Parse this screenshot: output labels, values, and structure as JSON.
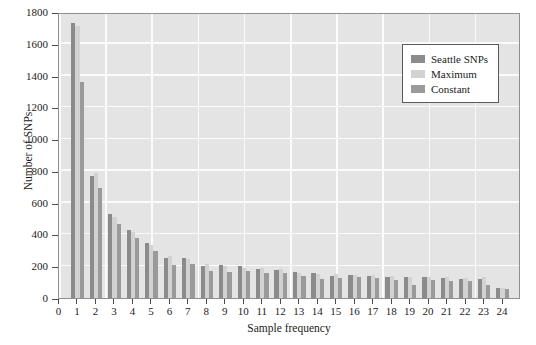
{
  "chart_data": {
    "type": "bar",
    "title": "",
    "xlabel": "Sample frequency",
    "ylabel": "Number of SNPs",
    "categories": [
      1,
      2,
      3,
      4,
      5,
      6,
      7,
      8,
      9,
      10,
      11,
      12,
      13,
      14,
      15,
      16,
      17,
      18,
      19,
      20,
      21,
      22,
      23,
      24
    ],
    "xlim": [
      0,
      25
    ],
    "ylim": [
      0,
      1800
    ],
    "ytick_labels": [
      "0",
      "200",
      "400",
      "600",
      "800",
      "1000",
      "1200",
      "1400",
      "1600",
      "1800"
    ],
    "ytick_values": [
      0,
      200,
      400,
      600,
      800,
      1000,
      1200,
      1400,
      1600,
      1800
    ],
    "xtick_labels": [
      "0",
      "1",
      "2",
      "3",
      "4",
      "5",
      "6",
      "7",
      "8",
      "9",
      "10",
      "11",
      "12",
      "13",
      "14",
      "15",
      "16",
      "17",
      "18",
      "19",
      "20",
      "21",
      "22",
      "23",
      "24"
    ],
    "xtick_values": [
      0,
      1,
      2,
      3,
      4,
      5,
      6,
      7,
      8,
      9,
      10,
      11,
      12,
      13,
      14,
      15,
      16,
      17,
      18,
      19,
      20,
      21,
      22,
      23,
      24
    ],
    "grid": true,
    "legend_position": "top-right",
    "series": [
      {
        "name": "Seattle SNPs",
        "color": "#8b8b8b",
        "values": [
          1730,
          770,
          530,
          430,
          345,
          250,
          250,
          200,
          205,
          200,
          185,
          175,
          165,
          160,
          140,
          145,
          140,
          135,
          135,
          135,
          125,
          120,
          120,
          60
        ]
      },
      {
        "name": "Maximum",
        "color": "#d2d2d2",
        "values": [
          1710,
          785,
          510,
          415,
          335,
          265,
          245,
          215,
          200,
          190,
          190,
          180,
          160,
          150,
          150,
          145,
          145,
          140,
          135,
          130,
          130,
          125,
          130,
          62
        ]
      },
      {
        "name": "Constant",
        "color": "#9a9a9a",
        "values": [
          1360,
          690,
          465,
          380,
          295,
          205,
          215,
          170,
          165,
          170,
          160,
          155,
          140,
          120,
          125,
          130,
          125,
          115,
          85,
          115,
          110,
          105,
          85,
          55
        ]
      }
    ]
  },
  "legend": {
    "items": [
      {
        "label": "Seattle SNPs",
        "color": "#8b8b8b"
      },
      {
        "label": "Maximum",
        "color": "#d2d2d2"
      },
      {
        "label": "Constant",
        "color": "#9a9a9a"
      }
    ]
  },
  "colors": {
    "plot_background": "#e4e4e4",
    "grid": "#fbfbfb",
    "axis": "#8f8f8f",
    "text": "#1b1b1b",
    "figure_background": "#ffffff"
  }
}
